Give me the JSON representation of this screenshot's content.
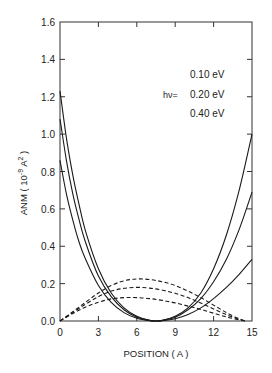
{
  "chart_data": {
    "type": "line",
    "title": "",
    "xlabel": "POSITION ( A )",
    "ylabel": "ANM ( 10^-9 A^2 )",
    "ylabel_parts": {
      "main": "ANM ( 10",
      "exp": "-9",
      "mid": " A",
      "exp2": "2",
      "end": " )"
    },
    "xlim": [
      0,
      15
    ],
    "ylim": [
      0.0,
      1.6
    ],
    "xticks": [
      0,
      3,
      6,
      9,
      12,
      15
    ],
    "xtick_labels": [
      "0",
      "3",
      "6",
      "9",
      "12",
      "15"
    ],
    "yticks": [
      0.0,
      0.2,
      0.4,
      0.6,
      0.8,
      1.0,
      1.2,
      1.4,
      1.6
    ],
    "ytick_labels": [
      "0.0",
      "0.2",
      "0.4",
      "0.6",
      "0.8",
      "1.0",
      "1.2",
      "1.4",
      "1.6"
    ],
    "grid": false,
    "legend": {
      "prefix": "hν=",
      "entries": [
        "0.10 eV",
        "0.20 eV",
        "0.40 eV"
      ],
      "position": "upper right"
    },
    "series": [
      {
        "name": "solid-1",
        "style": "solid",
        "x": [
          0,
          0.5,
          1,
          1.5,
          2,
          3,
          4,
          5,
          6,
          7,
          7.5,
          8,
          9,
          10,
          11,
          12,
          13,
          14,
          15
        ],
        "y": [
          1.23,
          0.98,
          0.78,
          0.62,
          0.48,
          0.28,
          0.15,
          0.07,
          0.025,
          0.003,
          0.0,
          0.003,
          0.025,
          0.07,
          0.15,
          0.28,
          0.46,
          0.7,
          1.0
        ]
      },
      {
        "name": "solid-2",
        "style": "solid",
        "x": [
          0,
          0.5,
          1,
          1.5,
          2,
          3,
          4,
          5,
          6,
          7,
          7.5,
          8,
          9,
          10,
          11,
          12,
          13,
          14,
          15
        ],
        "y": [
          1.08,
          0.86,
          0.68,
          0.54,
          0.42,
          0.24,
          0.13,
          0.06,
          0.02,
          0.003,
          0.0,
          0.003,
          0.02,
          0.06,
          0.12,
          0.21,
          0.33,
          0.49,
          0.69
        ]
      },
      {
        "name": "solid-3",
        "style": "solid",
        "x": [
          0,
          0.5,
          1,
          1.5,
          2,
          3,
          4,
          5,
          6,
          7,
          7.5,
          8,
          9,
          10,
          11,
          12,
          13,
          14,
          15
        ],
        "y": [
          0.86,
          0.68,
          0.54,
          0.42,
          0.33,
          0.19,
          0.1,
          0.045,
          0.015,
          0.002,
          0.0,
          0.002,
          0.012,
          0.035,
          0.07,
          0.12,
          0.18,
          0.25,
          0.33
        ]
      },
      {
        "name": "dashed-1",
        "style": "dashed",
        "x": [
          0,
          1,
          2,
          3,
          4,
          5,
          6,
          7,
          8,
          9,
          10,
          11,
          12,
          13,
          14,
          14.5
        ],
        "y": [
          0.0,
          0.05,
          0.1,
          0.15,
          0.19,
          0.215,
          0.225,
          0.222,
          0.21,
          0.19,
          0.16,
          0.125,
          0.085,
          0.045,
          0.012,
          0.0
        ]
      },
      {
        "name": "dashed-2",
        "style": "dashed",
        "x": [
          0,
          1,
          2,
          3,
          4,
          5,
          6,
          7,
          8,
          9,
          10,
          11,
          12,
          13,
          14,
          14.5
        ],
        "y": [
          0.0,
          0.045,
          0.09,
          0.13,
          0.16,
          0.175,
          0.18,
          0.176,
          0.165,
          0.148,
          0.125,
          0.096,
          0.065,
          0.034,
          0.009,
          0.0
        ]
      },
      {
        "name": "dashed-3",
        "style": "dashed",
        "x": [
          0,
          1,
          2,
          3,
          4,
          5,
          6,
          7,
          8,
          9,
          10,
          11,
          12,
          13,
          14,
          14.5
        ],
        "y": [
          0.0,
          0.04,
          0.075,
          0.1,
          0.118,
          0.125,
          0.125,
          0.12,
          0.11,
          0.097,
          0.08,
          0.062,
          0.042,
          0.022,
          0.006,
          0.0
        ]
      }
    ]
  },
  "style": {
    "line_color": "#1a1a1a",
    "axis_color": "#333333",
    "background": "#ffffff"
  }
}
